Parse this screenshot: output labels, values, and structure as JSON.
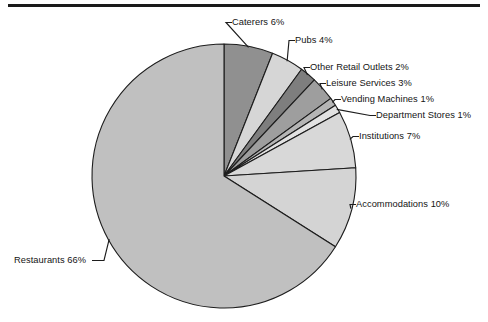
{
  "figure": {
    "background_color": "#ffffff",
    "rule_color": "#1a1a1a",
    "outline_color": "#1d1d1d",
    "text_color": "#141414"
  },
  "chart_data": {
    "type": "pie",
    "title": "",
    "xlabel": "",
    "ylabel": "",
    "legend_position": "none",
    "grid": false,
    "start_angle_deg": 0,
    "direction": "clockwise",
    "total": 100,
    "units": "percent",
    "categories": [
      "Caterers",
      "Pubs",
      "Other Retail Outlets",
      "Leisure Services",
      "Vending Machines",
      "Department Stores",
      "Institutions",
      "Accommodations",
      "Restaurants"
    ],
    "values": [
      6,
      4,
      2,
      3,
      1,
      1,
      7,
      10,
      66
    ],
    "labels": [
      "Caterers 6%",
      "Pubs 4%",
      "Other Retail Outlets 2%",
      "Leisure Services 3%",
      "Vending Machines 1%",
      "Department Stores 1%",
      "Institutions 7%",
      "Accommodations 10%",
      "Restaurants 66%"
    ],
    "colors": [
      "#909090",
      "#d6d6d6",
      "#7e7e7e",
      "#9e9e9e",
      "#b5b5b5",
      "#e2e2e2",
      "#d8d8d8",
      "#d4d4d4",
      "#c0c0c0"
    ]
  },
  "geometry": {
    "center_x": 224,
    "center_y": 176,
    "radius": 132
  },
  "label_positions": [
    {
      "key": "caterers",
      "x": 232,
      "y": 17,
      "align": "left"
    },
    {
      "key": "pubs",
      "x": 295,
      "y": 35,
      "align": "left"
    },
    {
      "key": "other_retail",
      "x": 310,
      "y": 62,
      "align": "left"
    },
    {
      "key": "leisure",
      "x": 326,
      "y": 78,
      "align": "left"
    },
    {
      "key": "vending",
      "x": 341,
      "y": 94,
      "align": "left"
    },
    {
      "key": "department",
      "x": 376,
      "y": 110,
      "align": "left"
    },
    {
      "key": "institutions",
      "x": 359,
      "y": 131,
      "align": "left"
    },
    {
      "key": "accommodations",
      "x": 356,
      "y": 199,
      "align": "left"
    },
    {
      "key": "restaurants",
      "x": 14,
      "y": 255,
      "align": "left"
    }
  ]
}
